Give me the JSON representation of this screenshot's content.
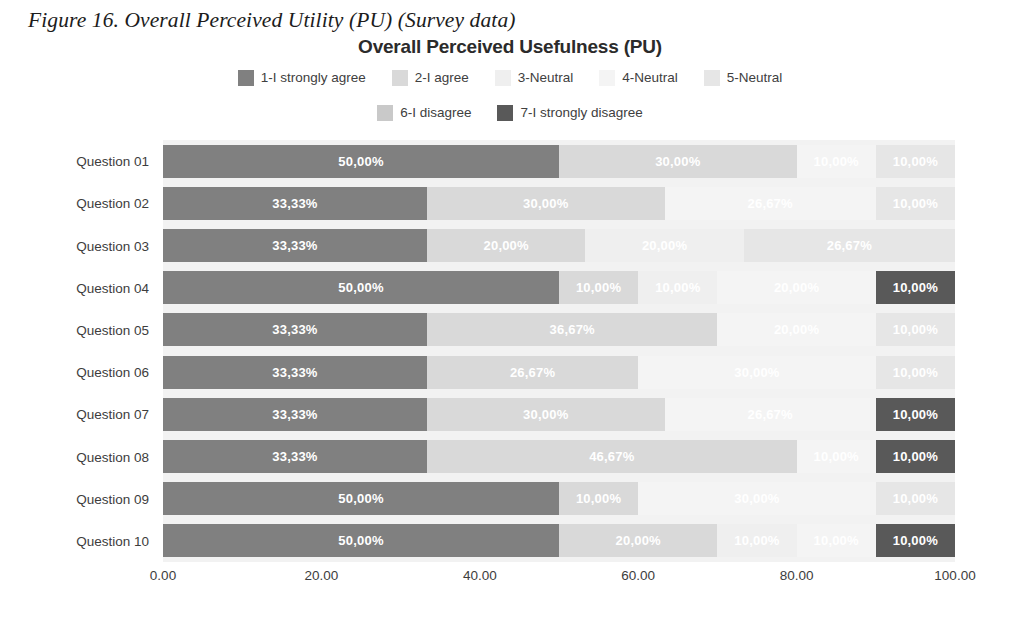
{
  "figure": {
    "caption": "Figure 16. Overall Perceived Utility (PU) (Survey data)"
  },
  "chart_data": {
    "type": "bar",
    "subtype": "stacked-horizontal-100pct",
    "title": "Overall Perceived Usefulness (PU)",
    "xlabel": "",
    "ylabel": "",
    "xlim": [
      0,
      100
    ],
    "xticks": [
      "0.00",
      "20.00",
      "40.00",
      "60.00",
      "80.00",
      "100.00"
    ],
    "xtick_values": [
      0,
      20,
      40,
      60,
      80,
      100
    ],
    "grid": false,
    "legend_position": "top",
    "categories": [
      "Question 01",
      "Question 02",
      "Question 03",
      "Question 04",
      "Question 05",
      "Question 06",
      "Question 07",
      "Question 08",
      "Question 09",
      "Question 10"
    ],
    "series": [
      {
        "name": "1-I strongly agree",
        "color": "#808080",
        "values": [
          50.0,
          33.33,
          33.33,
          50.0,
          33.33,
          33.33,
          33.33,
          33.33,
          50.0,
          50.0
        ],
        "labels": [
          "50,00%",
          "33,33%",
          "33,33%",
          "50,00%",
          "33,33%",
          "33,33%",
          "33,33%",
          "33,33%",
          "50,00%",
          "50,00%"
        ]
      },
      {
        "name": "2-I agree",
        "color": "#d9d9d9",
        "values": [
          30.0,
          30.0,
          20.0,
          10.0,
          36.67,
          26.67,
          30.0,
          46.67,
          10.0,
          20.0
        ],
        "labels": [
          "30,00%",
          "30,00%",
          "20,00%",
          "10,00%",
          "36,67%",
          "26,67%",
          "30,00%",
          "46,67%",
          "10,00%",
          "20,00%"
        ]
      },
      {
        "name": "3-Neutral",
        "color": "#efefef",
        "values": [
          0.0,
          0.0,
          20.0,
          10.0,
          0.0,
          0.0,
          0.0,
          0.0,
          0.0,
          10.0
        ],
        "labels": [
          "",
          "",
          "20,00%",
          "10,00%",
          "",
          "",
          "",
          "",
          "",
          "10,00%"
        ]
      },
      {
        "name": "4-Neutral",
        "color": "#f4f4f4",
        "values": [
          10.0,
          26.67,
          0.0,
          20.0,
          20.0,
          30.0,
          26.67,
          10.0,
          30.0,
          10.0
        ],
        "labels": [
          "10,00%",
          "26,67%",
          "",
          "20,00%",
          "20,00%",
          "30,00%",
          "26,67%",
          "10,00%",
          "30,00%",
          "10,00%"
        ]
      },
      {
        "name": "5-Neutral",
        "color": "#e6e6e6",
        "values": [
          10.0,
          10.0,
          26.67,
          0.0,
          10.0,
          10.0,
          0.0,
          0.0,
          10.0,
          0.0
        ],
        "labels": [
          "10,00%",
          "10,00%",
          "26,67%",
          "",
          "10,00%",
          "10,00%",
          "",
          "",
          "10,00%",
          ""
        ]
      },
      {
        "name": "6-I disagree",
        "color": "#c9c9c9",
        "values": [
          0.0,
          0.0,
          0.0,
          0.0,
          0.0,
          0.0,
          0.0,
          0.0,
          0.0,
          0.0
        ],
        "labels": [
          "",
          "",
          "",
          "",
          "",
          "",
          "",
          "",
          "",
          ""
        ]
      },
      {
        "name": "7-I strongly disagree",
        "color": "#595959",
        "values": [
          0.0,
          0.0,
          0.0,
          10.0,
          0.0,
          0.0,
          10.0,
          10.0,
          0.0,
          10.0
        ],
        "labels": [
          "",
          "",
          "",
          "10,00%",
          "",
          "",
          "10,00%",
          "10,00%",
          "",
          "10,00%"
        ]
      }
    ]
  },
  "colors": {
    "plot_background": "#f2f2f2",
    "label_text": "#ffffff",
    "axis_text": "#3d3d3d"
  }
}
